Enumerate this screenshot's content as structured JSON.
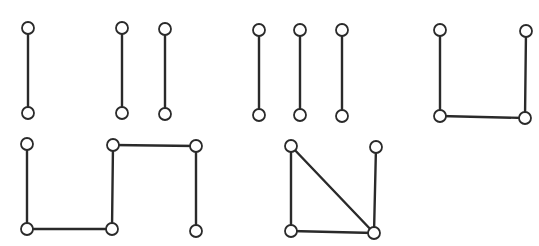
{
  "diagram": {
    "title_cropped": true,
    "colors": {
      "stroke": "#2a2a2a",
      "node_fill": "#ffffff",
      "background": "#ffffff"
    },
    "node_radius": 6,
    "graphs": [
      {
        "id": "g1",
        "nodes": [
          [
            28,
            28
          ],
          [
            28,
            113
          ]
        ],
        "edges": [
          [
            0,
            1
          ]
        ]
      },
      {
        "id": "g2",
        "nodes": [
          [
            122,
            28
          ],
          [
            122,
            113
          ],
          [
            165,
            29
          ],
          [
            165,
            114
          ]
        ],
        "edges": [
          [
            0,
            1
          ],
          [
            2,
            3
          ]
        ]
      },
      {
        "id": "g3",
        "nodes": [
          [
            259,
            30
          ],
          [
            259,
            115
          ],
          [
            300,
            30
          ],
          [
            300,
            115
          ],
          [
            342,
            30
          ],
          [
            342,
            116
          ]
        ],
        "edges": [
          [
            0,
            1
          ],
          [
            2,
            3
          ],
          [
            4,
            5
          ]
        ]
      },
      {
        "id": "g4",
        "nodes": [
          [
            440,
            30
          ],
          [
            440,
            116
          ],
          [
            525,
            118
          ],
          [
            526,
            31
          ]
        ],
        "edges": [
          [
            0,
            1
          ],
          [
            1,
            2
          ],
          [
            2,
            3
          ]
        ]
      },
      {
        "id": "g5",
        "nodes": [
          [
            27,
            144
          ],
          [
            27,
            229
          ],
          [
            112,
            229
          ],
          [
            113,
            145
          ],
          [
            196,
            146
          ],
          [
            196,
            231
          ]
        ],
        "edges": [
          [
            0,
            1
          ],
          [
            1,
            2
          ],
          [
            2,
            3
          ],
          [
            3,
            4
          ],
          [
            4,
            5
          ]
        ]
      },
      {
        "id": "g6",
        "nodes": [
          [
            291,
            146
          ],
          [
            291,
            231
          ],
          [
            374,
            233
          ],
          [
            376,
            147
          ]
        ],
        "edges": [
          [
            0,
            1
          ],
          [
            1,
            2
          ],
          [
            0,
            2
          ],
          [
            3,
            2
          ]
        ]
      }
    ]
  }
}
